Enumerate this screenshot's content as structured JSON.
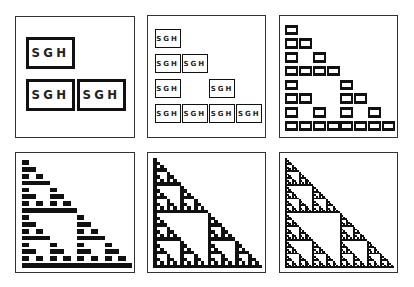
{
  "figure": {
    "label": "SGH",
    "colors": {
      "ink": "#111111",
      "frame": "#333333",
      "background": "#ffffff"
    },
    "panels": [
      {
        "id": "p1",
        "rows": 2,
        "style": "labeled",
        "x": 15,
        "y": 16,
        "w": 120,
        "h": 122,
        "inner": {
          "x": 9,
          "y": 15,
          "w": 102,
          "h": 84
        }
      },
      {
        "id": "p2",
        "rows": 4,
        "style": "labeled",
        "x": 147,
        "y": 15,
        "w": 119,
        "h": 123,
        "inner": {
          "x": 6,
          "y": 10,
          "w": 109,
          "h": 100
        }
      },
      {
        "id": "p3",
        "rows": 8,
        "style": "labeled",
        "x": 279,
        "y": 15,
        "w": 119,
        "h": 123,
        "inner": {
          "x": 5,
          "y": 7,
          "w": 110,
          "h": 110
        }
      },
      {
        "id": "p4",
        "rows": 16,
        "style": "bar",
        "x": 15,
        "y": 152,
        "w": 120,
        "h": 121,
        "inner": {
          "x": 6,
          "y": 6,
          "w": 110,
          "h": 110
        }
      },
      {
        "id": "p5",
        "rows": 32,
        "style": "solid",
        "x": 147,
        "y": 152,
        "w": 119,
        "h": 121,
        "inner": {
          "x": 5,
          "y": 5,
          "w": 109,
          "h": 110
        }
      },
      {
        "id": "p6",
        "rows": 64,
        "style": "solid",
        "x": 279,
        "y": 152,
        "w": 119,
        "h": 121,
        "inner": {
          "x": 5,
          "y": 5,
          "w": 109,
          "h": 110
        }
      }
    ]
  }
}
